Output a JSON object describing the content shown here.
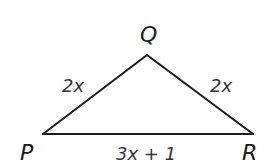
{
  "figure": {
    "type": "isosceles-triangle",
    "vertices": {
      "P": "P",
      "Q": "Q",
      "R": "R"
    },
    "sides": {
      "PQ": "2x",
      "QR": "2x",
      "PR": "3x + 1"
    },
    "colors": {
      "stroke": "#1a1a1a",
      "background": "#ffffff"
    }
  }
}
